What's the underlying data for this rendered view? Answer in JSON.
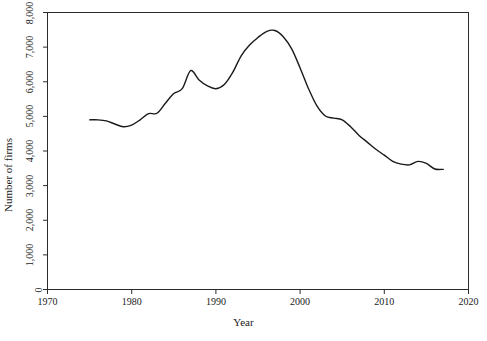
{
  "chart_data": {
    "type": "line",
    "title": "",
    "xlabel": "Year",
    "ylabel": "Number of firms",
    "xlim": [
      1970,
      2020
    ],
    "ylim": [
      0,
      8000
    ],
    "xticks": [
      1970,
      1980,
      1990,
      2000,
      2010,
      2020
    ],
    "xtick_labels": [
      "1970",
      "1980",
      "1990",
      "2000",
      "2010",
      "2020"
    ],
    "yticks": [
      0,
      1000,
      2000,
      3000,
      4000,
      5000,
      6000,
      7000,
      8000
    ],
    "ytick_labels": [
      "0",
      "1,000",
      "2,000",
      "3,000",
      "4,000",
      "5,000",
      "6,000",
      "7,000",
      "8,000"
    ],
    "grid": false,
    "legend": false,
    "line_color": "#1a1a1a",
    "line_width": 1.4,
    "frame": true,
    "x": [
      1975,
      1976,
      1977,
      1978,
      1979,
      1980,
      1981,
      1982,
      1983,
      1984,
      1985,
      1986,
      1987,
      1988,
      1989,
      1990,
      1991,
      1992,
      1993,
      1994,
      1995,
      1996,
      1997,
      1998,
      1999,
      2000,
      2001,
      2002,
      2003,
      2004,
      2005,
      2006,
      2007,
      2008,
      2009,
      2010,
      2011,
      2012,
      2013,
      2014,
      2015,
      2016,
      2017
    ],
    "values": [
      4900,
      4900,
      4870,
      4780,
      4700,
      4750,
      4900,
      5080,
      5090,
      5380,
      5660,
      5800,
      6320,
      6050,
      5880,
      5800,
      5920,
      6270,
      6750,
      7060,
      7280,
      7450,
      7480,
      7300,
      6950,
      6400,
      5800,
      5300,
      5010,
      4950,
      4900,
      4700,
      4450,
      4250,
      4050,
      3880,
      3700,
      3620,
      3600,
      3700,
      3640,
      3480,
      3470
    ]
  },
  "axis": {
    "y_title": "Number of firms",
    "x_title": "Year"
  }
}
